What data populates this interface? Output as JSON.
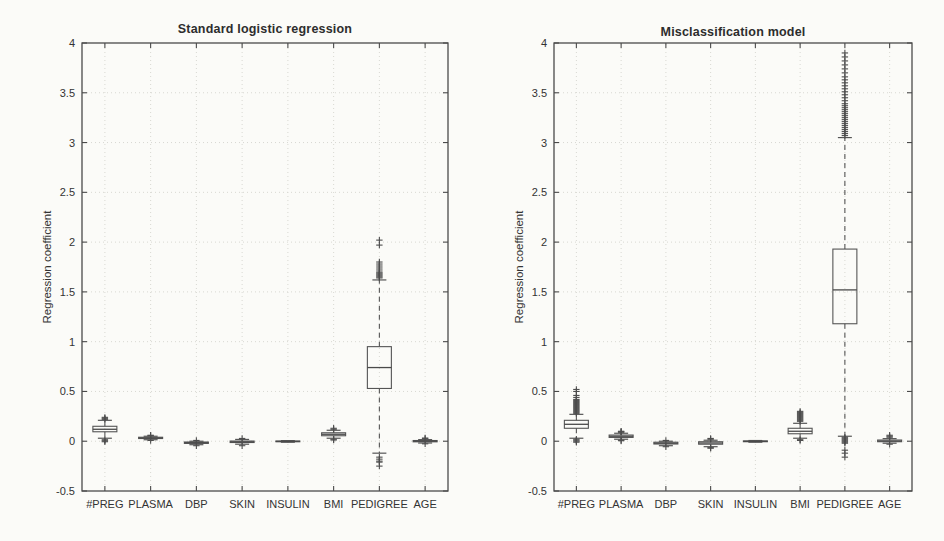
{
  "style": {
    "page_background": "#fbfbf8",
    "axis_color": "#4a4a4a",
    "box_color": "#555555",
    "median_color": "#4a4a4a",
    "outlier_color": "#4d4d4d",
    "grid_color": "#d8d8d2",
    "text_color": "#333333"
  },
  "chart_data": [
    {
      "type": "boxplot",
      "title": "Standard logistic regression",
      "ylabel": "Regression coefficient",
      "xlabel": "",
      "ylim": [
        -0.5,
        4
      ],
      "grid": "on",
      "legend": "none",
      "ytick_values": [
        4,
        3.5,
        3,
        2.5,
        2,
        1.5,
        1,
        0.5,
        0,
        -0.5
      ],
      "ytick_labels": [
        "4",
        "3.5",
        "3",
        "2.5",
        "2",
        "1.5",
        "1",
        "0.5",
        "0",
        "-0.5"
      ],
      "categories": [
        "#PREG",
        "PLASMA",
        "DBP",
        "SKIN",
        "INSULIN",
        "BMI",
        "PEDIGREE",
        "AGE"
      ],
      "boxes": [
        {
          "whislo": 0.03,
          "q1": 0.095,
          "med": 0.12,
          "q3": 0.15,
          "whishi": 0.21,
          "outliers": [
            0.22,
            0.23,
            0.24,
            0.015,
            0.005,
            -0.005
          ]
        },
        {
          "whislo": 0.015,
          "q1": 0.027,
          "med": 0.033,
          "q3": 0.04,
          "whishi": 0.05,
          "outliers": [
            0.055,
            0.06,
            0.008
          ]
        },
        {
          "whislo": -0.035,
          "q1": -0.022,
          "med": -0.015,
          "q3": -0.008,
          "whishi": 0.0,
          "outliers": [
            -0.045,
            0.008
          ]
        },
        {
          "whislo": -0.03,
          "q1": -0.013,
          "med": -0.006,
          "q3": 0.002,
          "whishi": 0.018,
          "outliers": [
            -0.045,
            0.028
          ]
        },
        {
          "whislo": -0.01,
          "q1": -0.005,
          "med": -0.002,
          "q3": 0.002,
          "whishi": 0.006,
          "outliers": []
        },
        {
          "whislo": 0.03,
          "q1": 0.055,
          "med": 0.07,
          "q3": 0.085,
          "whishi": 0.11,
          "outliers": [
            0.12,
            0.13,
            0.02,
            0.012
          ]
        },
        {
          "whislo": -0.12,
          "q1": 0.53,
          "med": 0.74,
          "q3": 0.95,
          "whishi": 1.62,
          "outliers": [
            2.02,
            1.97,
            1.8,
            1.78,
            1.76,
            1.74,
            1.72,
            1.7,
            1.69,
            1.68,
            1.67,
            1.66,
            1.65,
            1.64,
            -0.16,
            -0.18,
            -0.2,
            -0.21,
            -0.25
          ]
        },
        {
          "whislo": -0.018,
          "q1": -0.006,
          "med": 0.0,
          "q3": 0.007,
          "whishi": 0.016,
          "outliers": [
            0.026,
            0.032,
            -0.026
          ]
        }
      ]
    },
    {
      "type": "boxplot",
      "title": "Misclassification model",
      "ylabel": "Regression coefficient",
      "xlabel": "",
      "ylim": [
        -0.5,
        4
      ],
      "grid": "on",
      "legend": "none",
      "ytick_values": [
        4,
        3.5,
        3,
        2.5,
        2,
        1.5,
        1,
        0.5,
        0,
        -0.5
      ],
      "ytick_labels": [
        "4",
        "3.5",
        "3",
        "2.5",
        "2",
        "1.5",
        "1",
        "0.5",
        "0",
        "-0.5"
      ],
      "categories": [
        "#PREG",
        "PLASMA",
        "DBP",
        "SKIN",
        "INSULIN",
        "BMI",
        "PEDIGREE",
        "AGE"
      ],
      "boxes": [
        {
          "whislo": 0.03,
          "q1": 0.13,
          "med": 0.17,
          "q3": 0.21,
          "whishi": 0.27,
          "outliers": [
            0.28,
            0.29,
            0.3,
            0.31,
            0.32,
            0.33,
            0.34,
            0.35,
            0.36,
            0.37,
            0.38,
            0.39,
            0.4,
            0.41,
            0.42,
            0.44,
            0.46,
            0.5,
            0.52,
            0.02,
            0.01,
            0.0,
            -0.01
          ]
        },
        {
          "whislo": 0.02,
          "q1": 0.038,
          "med": 0.05,
          "q3": 0.062,
          "whishi": 0.08,
          "outliers": [
            0.09,
            0.095,
            0.1,
            0.01,
            0.005
          ]
        },
        {
          "whislo": -0.045,
          "q1": -0.028,
          "med": -0.02,
          "q3": -0.01,
          "whishi": 0.0,
          "outliers": [
            -0.055,
            0.008
          ]
        },
        {
          "whislo": -0.055,
          "q1": -0.03,
          "med": -0.018,
          "q3": -0.005,
          "whishi": 0.01,
          "outliers": [
            -0.07,
            -0.065,
            0.02,
            0.028
          ]
        },
        {
          "whislo": -0.01,
          "q1": -0.005,
          "med": -0.001,
          "q3": 0.003,
          "whishi": 0.007,
          "outliers": []
        },
        {
          "whislo": 0.03,
          "q1": 0.075,
          "med": 0.1,
          "q3": 0.13,
          "whishi": 0.18,
          "outliers": [
            0.2,
            0.21,
            0.22,
            0.23,
            0.24,
            0.25,
            0.26,
            0.27,
            0.28,
            0.29,
            0.3,
            0.015,
            0.008
          ]
        },
        {
          "whislo": 0.05,
          "q1": 1.18,
          "med": 1.52,
          "q3": 1.93,
          "whishi": 3.05,
          "outliers": [
            3.07,
            3.09,
            3.11,
            3.13,
            3.15,
            3.17,
            3.19,
            3.21,
            3.23,
            3.25,
            3.27,
            3.29,
            3.31,
            3.33,
            3.35,
            3.37,
            3.39,
            3.42,
            3.45,
            3.48,
            3.51,
            3.54,
            3.57,
            3.6,
            3.63,
            3.66,
            3.7,
            3.74,
            3.78,
            3.82,
            3.86,
            3.9,
            0.04,
            0.03,
            0.02,
            0.01,
            0.0,
            -0.01,
            -0.02,
            -0.09,
            -0.12,
            -0.16
          ]
        },
        {
          "whislo": -0.02,
          "q1": -0.005,
          "med": 0.002,
          "q3": 0.012,
          "whishi": 0.026,
          "outliers": [
            0.04,
            0.05,
            0.06,
            -0.03
          ]
        }
      ]
    }
  ]
}
